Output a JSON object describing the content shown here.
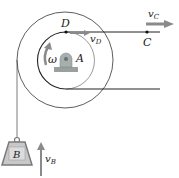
{
  "diagram": {
    "type": "pulley-kinematics",
    "labels": {
      "point_D": "D",
      "point_C": "C",
      "point_A": "A",
      "omega": "ω",
      "block_B": "B",
      "v_C": "v",
      "v_C_sub": "C",
      "v_D": "v",
      "v_D_sub": "D",
      "v_B": "v",
      "v_B_sub": "B"
    },
    "colors": {
      "line": "#222222",
      "circle": "#333333",
      "arrow": "#8a8a8a",
      "block_fill": "#c8c8c8",
      "block_stroke": "#7a7a7a",
      "bearing": "#9aa0a0"
    }
  }
}
